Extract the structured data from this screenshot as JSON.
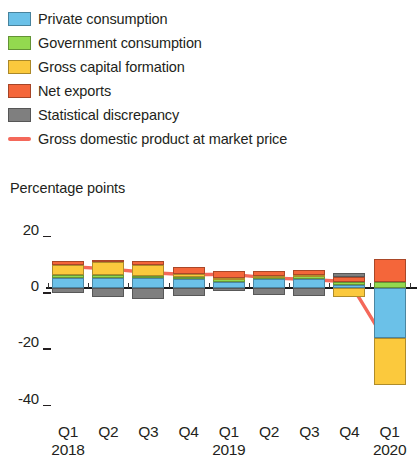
{
  "legend": {
    "items": [
      {
        "label": "Private consumption",
        "icon": "square-swatch-icon",
        "color": "#6BC1E8",
        "type": "swatch"
      },
      {
        "label": "Government consumption",
        "icon": "square-swatch-icon",
        "color": "#93D94F",
        "type": "swatch"
      },
      {
        "label": "Gross capital formation",
        "icon": "square-swatch-icon",
        "color": "#FBC93D",
        "type": "swatch"
      },
      {
        "label": "Net exports",
        "icon": "square-swatch-icon",
        "color": "#F4663A",
        "type": "swatch"
      },
      {
        "label": "Statistical discrepancy",
        "icon": "square-swatch-icon",
        "color": "#7F7F7F",
        "type": "swatch"
      },
      {
        "label": "Gross domestic product at market price",
        "icon": "line-swatch-icon",
        "color": "#F4685A",
        "type": "line"
      }
    ]
  },
  "axis": {
    "unit_label": "Percentage points",
    "y_ticks": [
      "20",
      "0",
      "-20",
      "-40"
    ],
    "y_values": [
      20,
      0,
      -20,
      -40
    ]
  },
  "chart_data": {
    "type": "bar",
    "subtype": "stacked-bar-with-line",
    "title": "",
    "subtitle": "",
    "xlabel": "",
    "ylabel": "Percentage points",
    "ylim": [
      -40,
      20
    ],
    "grid": false,
    "legend_position": "top",
    "categories": [
      "Q1",
      "Q2",
      "Q3",
      "Q4",
      "Q1",
      "Q2",
      "Q3",
      "Q4",
      "Q1"
    ],
    "year_labels": [
      "2018",
      "2019",
      "2020"
    ],
    "year_label_positions": [
      0,
      4,
      8
    ],
    "series": [
      {
        "name": "Private consumption",
        "color": "#6BC1E8",
        "values": [
          3.5,
          3.6,
          3.4,
          3.1,
          2.3,
          3.2,
          3.3,
          0.9,
          -17.7
        ]
      },
      {
        "name": "Government consumption",
        "color": "#93D94F",
        "values": [
          1.0,
          1.1,
          1.0,
          0.9,
          0.8,
          0.7,
          0.8,
          1.3,
          2.3
        ]
      },
      {
        "name": "Gross capital formation",
        "color": "#FBC93D",
        "values": [
          3.8,
          4.5,
          3.9,
          1.0,
          0.4,
          0.4,
          0.5,
          -3.2,
          -16.7
        ]
      },
      {
        "name": "Net exports",
        "color": "#F4663A",
        "values": [
          1.1,
          0.8,
          1.2,
          2.6,
          2.4,
          1.8,
          1.7,
          1.8,
          8.1
        ]
      },
      {
        "name": "Statistical discrepancy",
        "color": "#7F7F7F",
        "values": [
          -1.8,
          -3.2,
          -4.0,
          -2.9,
          -1.0,
          -2.5,
          -2.9,
          1.4,
          0.0
        ]
      }
    ],
    "line_series": {
      "name": "Gross domestic product at market price",
      "color": "#F4685A",
      "values": [
        7.6,
        6.8,
        5.5,
        4.7,
        4.9,
        3.6,
        3.0,
        2.2,
        -21.2
      ]
    }
  }
}
